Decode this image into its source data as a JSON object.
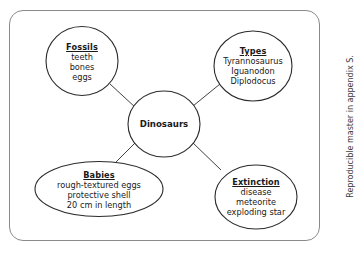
{
  "page": {
    "background_color": "#ffffff",
    "frame_border_color": "#8a8a8a",
    "stroke_color": "#2b2b2b",
    "text_color": "#1a1a1a"
  },
  "diagram": {
    "type": "concept-web",
    "center": {
      "label": "Dinosaurs"
    },
    "nodes": [
      {
        "id": "fossils",
        "heading": "Fossils",
        "items": [
          "teeth",
          "bones",
          "eggs"
        ],
        "shape": "circle"
      },
      {
        "id": "types",
        "heading": "Types",
        "items": [
          "Tyrannosaurus",
          "Iguanodon",
          "Diplodocus"
        ],
        "shape": "circle"
      },
      {
        "id": "babies",
        "heading": "Babies",
        "items": [
          "rough-textured eggs",
          "protective shell",
          "20 cm in length"
        ],
        "shape": "ellipse"
      },
      {
        "id": "extinction",
        "heading": "Extinction",
        "items": [
          "disease",
          "meteorite",
          "exploding star"
        ],
        "shape": "ellipse"
      }
    ]
  },
  "margin_note": {
    "text": "Reproducible master in appendix S."
  }
}
